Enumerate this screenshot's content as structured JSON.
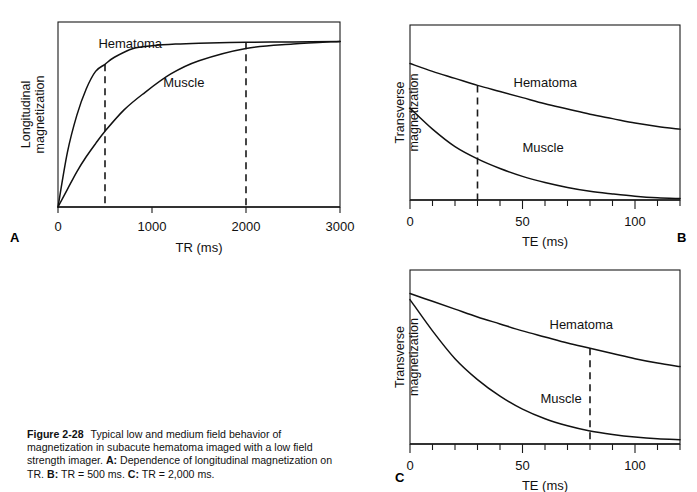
{
  "figure": {
    "number": "Figure 2-28",
    "caption_main": "Typical low and medium field behavior of magnetization in subacute hematoma imaged with a low field strength imager.",
    "caption_a_label": "A:",
    "caption_a_text": "Dependence of longitudinal magnetization on TR.",
    "caption_b_label": "B:",
    "caption_b_text": "TR = 500 ms.",
    "caption_c_label": "C:",
    "caption_c_text": "TR = 2,000 ms.",
    "panel_letters": {
      "a": "A",
      "b": "B",
      "c": "C"
    },
    "colors": {
      "ink": "#111111",
      "frame": "#1a1a1a",
      "background": "#ffffff"
    }
  },
  "chart_data": [
    {
      "id": "panel-a",
      "type": "line",
      "title": "",
      "xlabel": "TR (ms)",
      "ylabel": "Longitudinal magnetization",
      "ylabel_lines": [
        "Longitudinal",
        "magnetization"
      ],
      "xlim": [
        0,
        3000
      ],
      "ylim": [
        0,
        1.05
      ],
      "xticks": [
        0,
        1000,
        2000,
        3000
      ],
      "xticklabels": [
        "0",
        "1000",
        "2000",
        "3000"
      ],
      "yticks": [],
      "yticklabels": [],
      "grid": false,
      "frame": "box",
      "legend": "inline-labels",
      "annotations": [
        {
          "name": "tr-500-marker",
          "type": "vline",
          "x": 500,
          "label": "TR = 500 ms",
          "style": "dashed"
        },
        {
          "name": "tr-2000-marker",
          "type": "vline",
          "x": 2000,
          "label": "TR = 2,000 ms",
          "style": "dashed"
        }
      ],
      "series": [
        {
          "name": "Hematoma",
          "label": "Hematoma",
          "model": "recovery",
          "T1": 260,
          "amplitude": 0.935,
          "label_x": 430,
          "label_y": 0.905,
          "x": [
            0,
            100,
            200,
            300,
            400,
            500,
            600,
            800,
            1000,
            1250,
            1500,
            2000,
            2500,
            3000
          ],
          "y": [
            0,
            0.31,
            0.52,
            0.67,
            0.77,
            0.81,
            0.85,
            0.9,
            0.915,
            0.925,
            0.93,
            0.935,
            0.937,
            0.94
          ]
        },
        {
          "name": "Muscle",
          "label": "Muscle",
          "model": "recovery",
          "T1": 900,
          "amplitude": 0.95,
          "label_x": 1120,
          "label_y": 0.68,
          "x": [
            0,
            100,
            200,
            300,
            400,
            500,
            700,
            900,
            1200,
            1500,
            2000,
            2500,
            3000
          ],
          "y": [
            0,
            0.1,
            0.2,
            0.285,
            0.36,
            0.43,
            0.55,
            0.64,
            0.755,
            0.83,
            0.9,
            0.925,
            0.94
          ]
        }
      ]
    },
    {
      "id": "panel-b",
      "type": "line",
      "title": "",
      "xlabel": "TE (ms)",
      "ylabel": "Transverse magnetization",
      "ylabel_lines": [
        "Transverse",
        "magnetization"
      ],
      "xlim": [
        0,
        120
      ],
      "ylim": [
        0,
        1.0
      ],
      "xticks": [
        0,
        50,
        100
      ],
      "xticklabels": [
        "0",
        "50",
        "100"
      ],
      "xminorticks": [
        10,
        20,
        30,
        40,
        60,
        70,
        80,
        90,
        110,
        120
      ],
      "yticks": [],
      "yticklabels": [],
      "grid": false,
      "frame": "box",
      "legend": "inline-labels",
      "annotations": [
        {
          "name": "te-30-marker",
          "type": "vline",
          "x": 30,
          "label": "TE = 30 ms",
          "style": "dashed"
        }
      ],
      "series": [
        {
          "name": "Hematoma",
          "label": "Hematoma",
          "model": "decay",
          "T2": 175,
          "amplitude": 0.78,
          "label_x": 46,
          "label_y": 0.645,
          "x": [
            0,
            10,
            20,
            30,
            40,
            50,
            60,
            70,
            80,
            90,
            100,
            110,
            120
          ],
          "y": [
            0.78,
            0.735,
            0.695,
            0.655,
            0.62,
            0.585,
            0.55,
            0.52,
            0.49,
            0.465,
            0.44,
            0.42,
            0.405
          ]
        },
        {
          "name": "Muscle",
          "label": "Muscle",
          "model": "decay",
          "T2": 38,
          "amplitude": 0.525,
          "label_x": 50,
          "label_y": 0.275,
          "x": [
            0,
            10,
            20,
            30,
            40,
            50,
            60,
            70,
            80,
            90,
            100,
            110,
            120
          ],
          "y": [
            0.525,
            0.405,
            0.305,
            0.235,
            0.18,
            0.135,
            0.1,
            0.072,
            0.05,
            0.035,
            0.022,
            0.013,
            0.008
          ]
        }
      ]
    },
    {
      "id": "panel-c",
      "type": "line",
      "title": "",
      "xlabel": "TE (ms)",
      "ylabel": "Transverse magnetization",
      "ylabel_lines": [
        "Transverse",
        "magnetization"
      ],
      "xlim": [
        0,
        120
      ],
      "ylim": [
        0,
        1.0
      ],
      "xticks": [
        0,
        50,
        100
      ],
      "xticklabels": [
        "0",
        "50",
        "100"
      ],
      "xminorticks": [
        10,
        20,
        30,
        40,
        60,
        70,
        80,
        90,
        110,
        120
      ],
      "yticks": [],
      "yticklabels": [],
      "grid": false,
      "frame": "box",
      "legend": "inline-labels",
      "annotations": [
        {
          "name": "te-80-marker",
          "type": "vline",
          "x": 80,
          "label": "TE = 80 ms",
          "style": "dashed"
        }
      ],
      "series": [
        {
          "name": "Hematoma",
          "label": "Hematoma",
          "model": "decay",
          "T2": 175,
          "amplitude": 0.865,
          "label_x": 62,
          "label_y": 0.66,
          "x": [
            0,
            10,
            20,
            30,
            40,
            50,
            60,
            70,
            80,
            90,
            100,
            110,
            120
          ],
          "y": [
            0.865,
            0.82,
            0.775,
            0.73,
            0.69,
            0.65,
            0.615,
            0.58,
            0.55,
            0.52,
            0.49,
            0.465,
            0.445
          ]
        },
        {
          "name": "Muscle",
          "label": "Muscle",
          "model": "decay",
          "T2": 38,
          "amplitude": 0.83,
          "label_x": 58,
          "label_y": 0.235,
          "x": [
            0,
            10,
            20,
            30,
            40,
            50,
            60,
            70,
            80,
            90,
            100,
            110,
            120
          ],
          "y": [
            0.83,
            0.65,
            0.49,
            0.37,
            0.275,
            0.2,
            0.145,
            0.105,
            0.075,
            0.055,
            0.04,
            0.03,
            0.025
          ]
        }
      ]
    }
  ]
}
